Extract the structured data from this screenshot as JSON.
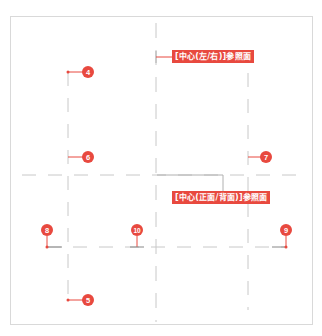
{
  "diagram": {
    "colors": {
      "accent": "#e8493f",
      "guide_line": "#c8c8c8",
      "frame": "#d9d9d9",
      "background": "#ffffff"
    },
    "labels": {
      "center_left_right": "[中心(左/右)]参照面",
      "center_front_back": "[中心(正面/背面)]参照面"
    },
    "markers": [
      {
        "id": "4",
        "label": "4"
      },
      {
        "id": "5",
        "label": "5"
      },
      {
        "id": "6",
        "label": "6"
      },
      {
        "id": "7",
        "label": "7"
      },
      {
        "id": "8",
        "label": "8"
      },
      {
        "id": "9",
        "label": "9"
      },
      {
        "id": "10",
        "label": "10"
      }
    ]
  }
}
